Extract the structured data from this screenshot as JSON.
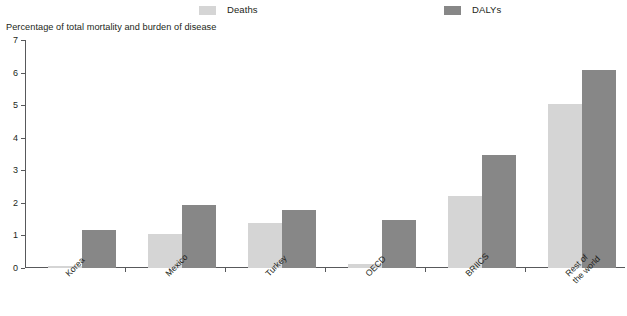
{
  "chart_data": {
    "type": "bar",
    "title": "",
    "subtitle": "",
    "ylabel": "Percentage of total mortality and burden of disease",
    "xlabel": "",
    "ylim": [
      0,
      7
    ],
    "yticks": [
      0,
      1,
      2,
      3,
      4,
      5,
      6,
      7
    ],
    "ytick_labels": [
      "0",
      "1",
      "2",
      "3",
      "4",
      "5",
      "6",
      "7"
    ],
    "grid": false,
    "legend_position": "top",
    "categories": [
      "Korea",
      "Mexico",
      "Turkey",
      "OECD",
      "BRIICS",
      "Rest of the world"
    ],
    "category_lines": [
      [
        "Korea"
      ],
      [
        "Mexico"
      ],
      [
        "Turkey"
      ],
      [
        "OECD"
      ],
      [
        "BRIICS"
      ],
      [
        "Rest of",
        "the world"
      ]
    ],
    "series": [
      {
        "name": "Deaths",
        "color": "#d5d5d5",
        "values": [
          0.07,
          1.03,
          1.38,
          0.13,
          2.2,
          5.03
        ]
      },
      {
        "name": "DALYs",
        "color": "#878787",
        "values": [
          1.17,
          1.95,
          1.78,
          1.47,
          3.47,
          6.07
        ]
      }
    ]
  },
  "legend": {
    "items": [
      {
        "label": "Deaths",
        "color": "#d5d5d5"
      },
      {
        "label": "DALYs",
        "color": "#878787"
      }
    ]
  },
  "axis": {
    "y_title": "Percentage of total mortality and burden of disease"
  },
  "colors": {
    "deaths": "#d5d5d5",
    "dalys": "#878787",
    "axis": "#58595b",
    "text": "#231f20",
    "background": "#ffffff"
  }
}
